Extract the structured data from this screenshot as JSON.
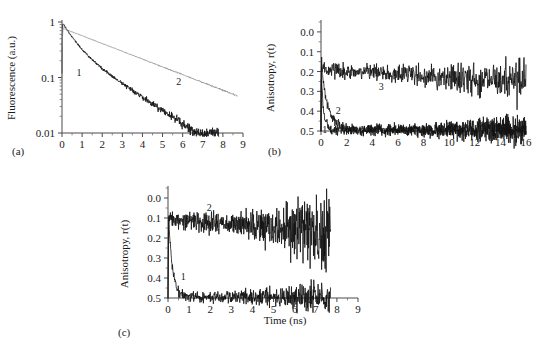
{
  "figure": {
    "background": "#ffffff",
    "curve_color_dark": "#111111",
    "curve_color_gray": "#8a8a8a"
  },
  "panels": [
    {
      "id": "a",
      "letter": "(a)",
      "ylabel": "Fluorescence (a.u.)",
      "xlabel": "",
      "yticks": [
        "1",
        "0.1",
        "0.01"
      ],
      "xticks": [
        "0",
        "1",
        "2",
        "3",
        "4",
        "5",
        "6",
        "7",
        "8",
        "9"
      ],
      "curve_labels": [
        "1",
        "2"
      ]
    },
    {
      "id": "b",
      "letter": "(b)",
      "ylabel": "Anisotropy, r(t)",
      "xlabel": "",
      "yticks": [
        "0.5",
        "0.4",
        "0.3",
        "0.2",
        "0.1",
        "0.0"
      ],
      "xticks": [
        "0",
        "2",
        "4",
        "6",
        "8",
        "10",
        "12",
        "14",
        "16"
      ],
      "curve_labels": [
        "1",
        "2",
        "3"
      ]
    },
    {
      "id": "c",
      "letter": "(c)",
      "ylabel": "Anisotropy, r(t)",
      "xlabel": "Time (ns)",
      "yticks": [
        "0.5",
        "0.4",
        "0.3",
        "0.2",
        "0.1",
        "0.0"
      ],
      "xticks": [
        "0",
        "1",
        "2",
        "3",
        "4",
        "5",
        "6",
        "7",
        "8",
        "9"
      ],
      "curve_labels": [
        "1",
        "2"
      ]
    }
  ],
  "chart_data": [
    {
      "type": "line",
      "panel": "a",
      "title": "",
      "xlabel": "",
      "ylabel": "Fluorescence (a.u.)",
      "xlim": [
        0,
        9
      ],
      "ylim": [
        0.01,
        1
      ],
      "yscale": "log",
      "grid": false,
      "legend": "inline-labels",
      "xticks": [
        0,
        1,
        2,
        3,
        4,
        5,
        6,
        7,
        8,
        9
      ],
      "yticks": [
        1,
        0.1,
        0.01
      ],
      "series": [
        {
          "name": "1",
          "color": "#111111",
          "label_position": {
            "x": 0.85,
            "y": 0.125
          },
          "model": "biexponential",
          "amplitude": 1.0,
          "components": [
            {
              "fraction": 0.62,
              "lifetime_ns": 0.55
            },
            {
              "fraction": 0.38,
              "lifetime_ns": 1.85
            }
          ],
          "noise_level": 0.055,
          "t_end_ns": 7.8,
          "x": [
            0,
            0.25,
            0.5,
            1,
            1.5,
            2,
            2.5,
            3,
            3.5,
            4,
            4.5,
            5,
            5.5,
            6,
            6.5,
            7,
            7.5
          ],
          "y": [
            1.0,
            0.72,
            0.52,
            0.3,
            0.19,
            0.128,
            0.089,
            0.063,
            0.046,
            0.034,
            0.026,
            0.02,
            0.016,
            0.013,
            0.012,
            0.011,
            0.01
          ]
        },
        {
          "name": "2",
          "color": "#8a8a8a",
          "label_position": {
            "x": 5.8,
            "y": 0.088
          },
          "model": "monoexponential",
          "amplitude": 0.78,
          "lifetime_ns": 3.1,
          "noise_level": 0.02,
          "t_end_ns": 8.7,
          "x": [
            0,
            0.5,
            1,
            2,
            3,
            4,
            5,
            6,
            7,
            8,
            8.7
          ],
          "y": [
            0.8,
            0.76,
            0.69,
            0.56,
            0.42,
            0.3,
            0.21,
            0.145,
            0.098,
            0.066,
            0.052
          ]
        }
      ]
    },
    {
      "type": "line",
      "panel": "b",
      "title": "",
      "xlabel": "",
      "ylabel": "Anisotropy, r(t)",
      "xlim": [
        0,
        16
      ],
      "ylim": [
        0.0,
        0.55
      ],
      "yscale": "linear",
      "grid": false,
      "legend": "inline-labels",
      "xticks": [
        0,
        2,
        4,
        6,
        8,
        10,
        12,
        14,
        16
      ],
      "yticks": [
        0.0,
        0.1,
        0.2,
        0.3,
        0.4,
        0.5
      ],
      "series": [
        {
          "name": "1",
          "color": "#111111",
          "label_position": {
            "x": 0.3,
            "y": 0.012
          },
          "model": "monoexponential-decay-to-zero",
          "r0": 0.35,
          "correlation_time_ns": 0.17,
          "r_infinity": 0.005,
          "noise_level": 0.012,
          "t_end_ns": 16,
          "x": [
            0,
            0.2,
            0.4,
            0.6,
            1.0,
            1.5,
            2,
            4,
            8,
            12,
            16
          ],
          "y": [
            0.35,
            0.11,
            0.035,
            0.015,
            0.006,
            0.004,
            0.003,
            0.003,
            0.002,
            0.003,
            0.002
          ]
        },
        {
          "name": "2",
          "color": "#111111",
          "label_position": {
            "x": 1.35,
            "y": 0.105
          },
          "model": "monoexponential-decay-to-zero",
          "r0": 0.35,
          "correlation_time_ns": 0.52,
          "r_infinity": 0.005,
          "noise_level": 0.012,
          "t_end_ns": 16,
          "x": [
            0,
            0.25,
            0.5,
            0.75,
            1.0,
            1.5,
            2.0,
            2.5,
            3,
            4,
            8,
            12,
            16
          ],
          "y": [
            0.35,
            0.215,
            0.133,
            0.083,
            0.052,
            0.022,
            0.01,
            0.006,
            0.004,
            0.003,
            0.003,
            0.002,
            0.003
          ]
        },
        {
          "name": "3",
          "color": "#111111",
          "label_position": {
            "x": 4.7,
            "y": 0.228
          },
          "model": "hindered-rotor-plateau",
          "r0": 0.35,
          "r_plateau_start": 0.31,
          "r_plateau_end": 0.25,
          "noise_level": 0.018,
          "t_end_ns": 16,
          "x": [
            0,
            0.3,
            1,
            2,
            4,
            6,
            8,
            10,
            12,
            14,
            16
          ],
          "y": [
            0.35,
            0.315,
            0.31,
            0.305,
            0.3,
            0.292,
            0.281,
            0.27,
            0.262,
            0.255,
            0.25
          ]
        }
      ]
    },
    {
      "type": "line",
      "panel": "c",
      "title": "",
      "xlabel": "Time (ns)",
      "ylabel": "Anisotropy, r(t)",
      "xlim": [
        0,
        9
      ],
      "ylim": [
        0.0,
        0.55
      ],
      "yscale": "linear",
      "grid": false,
      "legend": "inline-labels",
      "xticks": [
        0,
        1,
        2,
        3,
        4,
        5,
        6,
        7,
        8,
        9
      ],
      "yticks": [
        0.0,
        0.1,
        0.2,
        0.3,
        0.4,
        0.5
      ],
      "series": [
        {
          "name": "1",
          "color": "#111111",
          "label_position": {
            "x": 0.72,
            "y": 0.108
          },
          "model": "monoexponential-decay-to-zero",
          "r0": 0.49,
          "correlation_time_ns": 0.18,
          "r_infinity": 0.006,
          "noise_level": 0.012,
          "t_end_ns": 7.7,
          "x": [
            0,
            0.15,
            0.3,
            0.5,
            0.75,
            1.0,
            1.5,
            2,
            3,
            4,
            5,
            6,
            7,
            7.7
          ],
          "y": [
            0.49,
            0.24,
            0.115,
            0.048,
            0.022,
            0.013,
            0.007,
            0.005,
            0.004,
            0.005,
            0.004,
            0.005,
            0.006,
            0.005
          ]
        },
        {
          "name": "2",
          "color": "#111111",
          "label_position": {
            "x": 1.95,
            "y": 0.455
          },
          "model": "hindered-rotor-plateau",
          "r0": 0.4,
          "r_plateau_start": 0.395,
          "r_plateau_end": 0.325,
          "noise_level_start": 0.022,
          "noise_level_end": 0.105,
          "t_end_ns": 7.7,
          "x": [
            0,
            0.5,
            1,
            2,
            3,
            4,
            5,
            6,
            7,
            7.7
          ],
          "y": [
            0.4,
            0.398,
            0.392,
            0.378,
            0.362,
            0.35,
            0.34,
            0.332,
            0.327,
            0.325
          ]
        }
      ]
    }
  ]
}
